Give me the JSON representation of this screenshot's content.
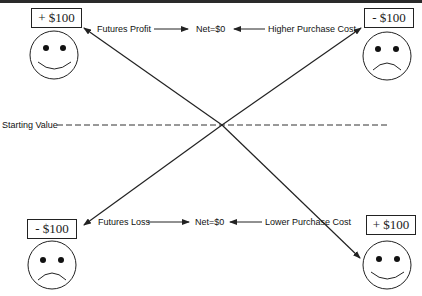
{
  "diagram": {
    "top_left": {
      "value": "+ $100",
      "face": "happy"
    },
    "top_right": {
      "value": "- $100",
      "face": "sad"
    },
    "bottom_left": {
      "value": "- $100",
      "face": "sad"
    },
    "bottom_right": {
      "value": "+ $100",
      "face": "happy"
    },
    "top_row": {
      "left_label": "Futures Profit",
      "center_label": "Net=$0",
      "right_label": "Higher Purchase Cost"
    },
    "bottom_row": {
      "left_label": "Futures Loss",
      "center_label": "Net=$0",
      "right_label": "Lower Purchase Cost"
    },
    "baseline_label": "Starting Value",
    "colors": {
      "line": "#222222",
      "border": "#2a2a2a",
      "background": "#ffffff"
    }
  }
}
